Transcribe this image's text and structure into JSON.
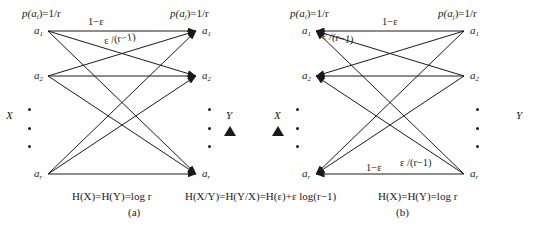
{
  "figure": {
    "panels": [
      {
        "tag": "(a)",
        "direction": "X-to-Y",
        "source_set": "X",
        "target_set": "Y",
        "source_prob_label": "p(a",
        "source_prob_sub": "i",
        "source_prob_tail": ")=1/r",
        "target_prob_label": "p(a",
        "target_prob_sub": "j",
        "target_prob_tail": ")=1/r",
        "nodes_left": [
          "a1",
          "a2",
          "ar"
        ],
        "nodes_right": [
          "a1",
          "a2",
          "ar"
        ],
        "edge_weight_correct": "1−ε",
        "edge_weight_error": "ε /(r−1)",
        "caption_entropy": "H(X)=H(Y)=log r",
        "caption_conditional": "H(X/Y)=H(Y/X)=H(ε)+ε log(r−1)"
      },
      {
        "tag": "(b)",
        "direction": "Y-to-X",
        "source_set": "Y",
        "target_set": "X",
        "source_prob_label": "p(a",
        "source_prob_sub": "i",
        "source_prob_tail": ")=1/r",
        "target_prob_label": "p(a",
        "target_prob_sub": "j",
        "target_prob_tail": ")=1/r",
        "nodes_left": [
          "a1",
          "a2",
          "ar"
        ],
        "nodes_right": [
          "a1",
          "a2",
          "ar"
        ],
        "edge_weight_correct": "1−ε",
        "edge_weight_error": "ε /(r−1)",
        "edge_weight_correct_bottom": "1−ε",
        "edge_weight_error_bottom": "ε /(r−1)",
        "caption_entropy": "H(X)=H(Y)=log r",
        "caption_conditional": ")=H(ε)+ ε log(r−1)"
      }
    ],
    "node_glyphs": {
      "a1_base": "a",
      "a1_sub": "1",
      "a2_base": "a",
      "a2_sub": "2",
      "ar_base": "a",
      "ar_sub": "r"
    },
    "middle_markers": {
      "left_set": "Y",
      "right_set": "X",
      "marker": "filled-triangle"
    },
    "colors": {
      "background": "#ffffff",
      "ink": "#1a1a1a"
    }
  }
}
